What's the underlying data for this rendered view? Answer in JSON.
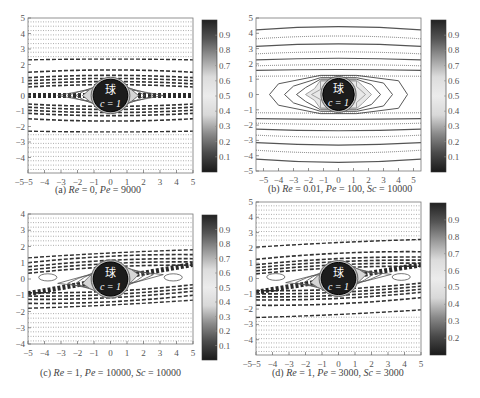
{
  "chart_data": [
    {
      "id": "a",
      "type": "heatmap",
      "subtype": "contour",
      "title": "(a) Re = 0, Pe = 9000",
      "caption_parts": {
        "label": "(a) ",
        "Re_label": "Re",
        "Re_value": " = 0, ",
        "Pe_label": "Pe",
        "Pe_value": " = 9000",
        "Sc_label": "",
        "Sc_value": ""
      },
      "params": {
        "Re": 0,
        "Pe": 9000
      },
      "xlim": [
        -5,
        5
      ],
      "ylim": [
        -5,
        5
      ],
      "xticks": [
        -5,
        -4,
        -3,
        -2,
        -1,
        0,
        1,
        2,
        3,
        4,
        5
      ],
      "yticks": [
        5,
        4,
        3,
        2,
        1,
        0,
        -1,
        -2,
        -3,
        -4
      ],
      "sphere_label": "球",
      "sphere_value": "c = 1",
      "colorbar": {
        "ticks": [
          0.9,
          0.8,
          0.7,
          0.6,
          0.5,
          0.4,
          0.3,
          0.2,
          0.1
        ],
        "range": [
          0,
          1
        ]
      }
    },
    {
      "id": "b",
      "type": "heatmap",
      "subtype": "contour",
      "title": "(b) Re = 0.01, Pe = 100, Sc = 10000",
      "caption_parts": {
        "label": "(b) ",
        "Re_label": "Re",
        "Re_value": " = 0.01, ",
        "Pe_label": "Pe",
        "Pe_value": " = 100, ",
        "Sc_label": "Sc",
        "Sc_value": " = 10000"
      },
      "params": {
        "Re": 0.01,
        "Pe": 100,
        "Sc": 10000
      },
      "xlim": [
        -5.5,
        5.5
      ],
      "ylim": [
        -5,
        5
      ],
      "xticks": [
        -5,
        -4,
        -3,
        -2,
        -1,
        0,
        1,
        2,
        3,
        4,
        5
      ],
      "yticks": [
        5,
        4,
        3,
        2,
        1,
        0,
        -1,
        -2,
        -3,
        -4,
        -5
      ],
      "sphere_label": "球",
      "sphere_value": "c = 1",
      "colorbar": {
        "ticks": [
          0.9,
          0.8,
          0.7,
          0.6,
          0.5,
          0.4,
          0.3,
          0.2,
          0.1
        ],
        "range": [
          0,
          1
        ]
      }
    },
    {
      "id": "c",
      "type": "heatmap",
      "subtype": "contour",
      "title": "(c) Re = 1, Pe = 10000, Sc = 10000",
      "caption_parts": {
        "label": "(c) ",
        "Re_label": "Re",
        "Re_value": " = 1, ",
        "Pe_label": "Pe",
        "Pe_value": " = 10000, ",
        "Sc_label": "Sc",
        "Sc_value": " = 10000"
      },
      "params": {
        "Re": 1,
        "Pe": 10000,
        "Sc": 10000
      },
      "xlim": [
        -5,
        5
      ],
      "ylim": [
        -4,
        4
      ],
      "xticks": [
        -5,
        -4,
        -3,
        -2,
        -1,
        0,
        1,
        2,
        3,
        4,
        5
      ],
      "yticks": [
        4,
        3,
        2,
        1,
        0,
        -1,
        -2,
        -3,
        -4
      ],
      "sphere_label": "球",
      "sphere_value": "c = 1",
      "colorbar": {
        "ticks": [
          0.9,
          0.8,
          0.7,
          0.6,
          0.5,
          0.4,
          0.3,
          0.2,
          0.1
        ],
        "range": [
          0,
          1
        ]
      }
    },
    {
      "id": "d",
      "type": "heatmap",
      "subtype": "contour",
      "title": "(d) Re = 1, Pe = 3000, Sc = 3000",
      "caption_parts": {
        "label": "(d) ",
        "Re_label": "Re",
        "Re_value": " = 1, ",
        "Pe_label": "Pe",
        "Pe_value": " = 3000, ",
        "Sc_label": "Sc",
        "Sc_value": " = 3000"
      },
      "params": {
        "Re": 1,
        "Pe": 3000,
        "Sc": 3000
      },
      "xlim": [
        -5,
        5
      ],
      "ylim": [
        -5,
        5
      ],
      "xticks": [
        -5,
        -4,
        -3,
        -2,
        -1,
        0,
        1,
        2,
        3,
        4,
        5
      ],
      "yticks": [
        5,
        4,
        3,
        2,
        1,
        0,
        -1,
        -2,
        -3,
        -4
      ],
      "sphere_label": "球",
      "sphere_value": "c = 1",
      "colorbar": {
        "ticks": [
          0.9,
          0.8,
          0.7,
          0.6,
          0.5,
          0.4,
          0.3,
          0.2
        ],
        "range": [
          0.1,
          1
        ]
      }
    }
  ],
  "colors": {
    "colormap_stops": [
      "#1a1a1a",
      "#4a4a4a",
      "#8a8a8a",
      "#d8d8d8",
      "#ececec",
      "#dcdcdc",
      "#9a9a9a",
      "#555555",
      "#222222"
    ],
    "sphere": "#1c1c1c",
    "axis": "#777777"
  }
}
